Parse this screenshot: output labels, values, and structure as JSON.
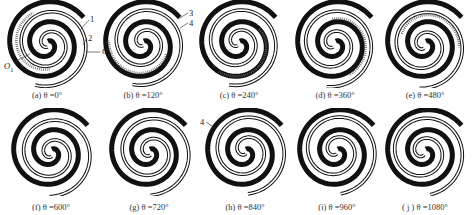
{
  "figure": {
    "panels": [
      {
        "id": "a",
        "caption": "(a) θ =0°",
        "theta": 0
      },
      {
        "id": "b",
        "caption": "(b) θ =120°",
        "theta": 120
      },
      {
        "id": "c",
        "caption": "(c) θ =240°",
        "theta": 240
      },
      {
        "id": "d",
        "caption": "(d) θ =360°",
        "theta": 360
      },
      {
        "id": "e",
        "caption": "(e) θ =480°",
        "theta": 480
      },
      {
        "id": "f",
        "caption": "(f) θ =600°",
        "theta": 600
      },
      {
        "id": "g",
        "caption": "(g) θ =720°",
        "theta": 720
      },
      {
        "id": "h",
        "caption": "(h) θ =840°",
        "theta": 840
      },
      {
        "id": "i",
        "caption": "(i) θ =960°",
        "theta": 960
      },
      {
        "id": "j",
        "caption": "( j ) θ =1080°",
        "theta": 1080
      }
    ],
    "annotations": {
      "label_1": "1",
      "label_2": "2",
      "label_3": "3",
      "label_4": "4",
      "label_4h": "4",
      "label_o1": "O",
      "label_o1_sub": "1",
      "label_o2": "O",
      "label_o2_sub": "2"
    }
  }
}
